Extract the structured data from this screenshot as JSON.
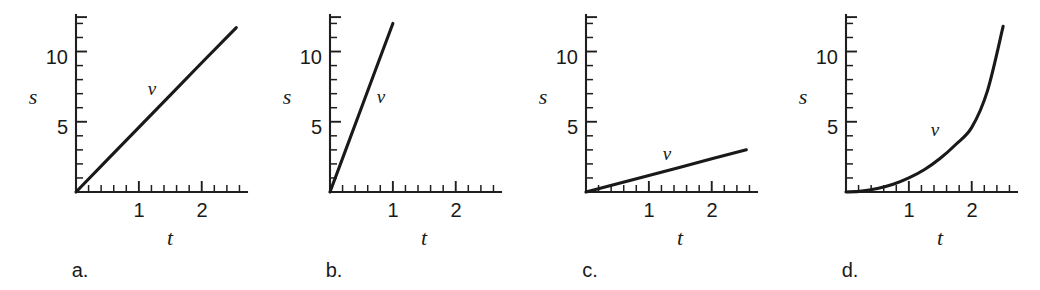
{
  "figure": {
    "background_color": "#ffffff",
    "ink_color": "#1a1a1a",
    "panel_count": 4
  },
  "chart_data": [
    {
      "type": "line",
      "panel_label": "a.",
      "title": "",
      "xlabel": "t",
      "ylabel": "s",
      "series_label": "v",
      "xlim": [
        0,
        2.72
      ],
      "ylim": [
        0,
        12.6
      ],
      "xticks_labeled": [
        1,
        2
      ],
      "xtick_labels": [
        "1",
        "2"
      ],
      "yticks_labeled": [
        5,
        10
      ],
      "ytick_labels": [
        "5",
        "10"
      ],
      "x_minor_tick_step": 0.2,
      "y_minor_tick_step": 1,
      "grid": false,
      "legend": "none",
      "description": "straight line through origin with moderate slope",
      "slope": 4.6,
      "intercept": 0,
      "x": [
        0,
        0.5,
        1,
        1.5,
        2,
        2.55
      ],
      "y": [
        0,
        2.3,
        4.6,
        6.9,
        9.2,
        11.7
      ]
    },
    {
      "type": "line",
      "panel_label": "b.",
      "title": "",
      "xlabel": "t",
      "ylabel": "s",
      "series_label": "v",
      "xlim": [
        0,
        2.72
      ],
      "ylim": [
        0,
        12.6
      ],
      "xticks_labeled": [
        1,
        2
      ],
      "xtick_labels": [
        "1",
        "2"
      ],
      "yticks_labeled": [
        5,
        10
      ],
      "ytick_labels": [
        "5",
        "10"
      ],
      "x_minor_tick_step": 0.2,
      "y_minor_tick_step": 1,
      "grid": false,
      "legend": "none",
      "description": "straight line through origin with steep slope, ends at t = 1",
      "slope": 12,
      "intercept": 0,
      "x": [
        0,
        0.25,
        0.5,
        0.75,
        1.0
      ],
      "y": [
        0,
        3,
        6,
        9,
        12
      ]
    },
    {
      "type": "line",
      "panel_label": "c.",
      "title": "",
      "xlabel": "t",
      "ylabel": "s",
      "series_label": "v",
      "xlim": [
        0,
        2.72
      ],
      "ylim": [
        0,
        12.6
      ],
      "xticks_labeled": [
        1,
        2
      ],
      "xtick_labels": [
        "1",
        "2"
      ],
      "yticks_labeled": [
        5,
        10
      ],
      "ytick_labels": [
        "5",
        "10"
      ],
      "x_minor_tick_step": 0.2,
      "y_minor_tick_step": 1,
      "grid": false,
      "legend": "none",
      "description": "straight line through origin with shallow slope",
      "slope": 1.18,
      "intercept": 0,
      "x": [
        0,
        0.5,
        1,
        1.5,
        2,
        2.55
      ],
      "y": [
        0,
        0.59,
        1.18,
        1.77,
        2.36,
        3.0
      ]
    },
    {
      "type": "line",
      "panel_label": "d.",
      "title": "",
      "xlabel": "t",
      "ylabel": "s",
      "series_label": "v",
      "xlim": [
        0,
        2.72
      ],
      "ylim": [
        0,
        12.6
      ],
      "xticks_labeled": [
        1,
        2
      ],
      "xtick_labels": [
        "1",
        "2"
      ],
      "yticks_labeled": [
        5,
        10
      ],
      "ytick_labels": [
        "5",
        "10"
      ],
      "x_minor_tick_step": 0.2,
      "y_minor_tick_step": 1,
      "grid": false,
      "legend": "none",
      "description": "upward-curving (accelerating) curve through origin",
      "x": [
        0,
        0.25,
        0.5,
        0.75,
        1.0,
        1.25,
        1.5,
        1.75,
        2.0,
        2.25,
        2.5
      ],
      "y": [
        0,
        0.06,
        0.25,
        0.55,
        1.0,
        1.6,
        2.4,
        3.4,
        4.6,
        7.2,
        11.8
      ]
    }
  ],
  "panels": [
    {
      "letter": "a.",
      "x_axis_label": "t",
      "y_axis_label": "s",
      "curve_label": "v",
      "x_tick_labels": [
        "1",
        "2"
      ],
      "y_tick_labels": [
        "5",
        "10"
      ]
    },
    {
      "letter": "b.",
      "x_axis_label": "t",
      "y_axis_label": "s",
      "curve_label": "v",
      "x_tick_labels": [
        "1",
        "2"
      ],
      "y_tick_labels": [
        "5",
        "10"
      ]
    },
    {
      "letter": "c.",
      "x_axis_label": "t",
      "y_axis_label": "s",
      "curve_label": "v",
      "x_tick_labels": [
        "1",
        "2"
      ],
      "y_tick_labels": [
        "5",
        "10"
      ]
    },
    {
      "letter": "d.",
      "x_axis_label": "t",
      "y_axis_label": "s",
      "curve_label": "v",
      "x_tick_labels": [
        "1",
        "2"
      ],
      "y_tick_labels": [
        "5",
        "10"
      ]
    }
  ]
}
